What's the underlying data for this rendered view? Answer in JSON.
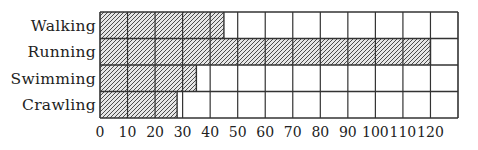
{
  "chart_data": {
    "type": "bar",
    "orientation": "horizontal",
    "title": "",
    "xlabel": "",
    "ylabel": "",
    "categories": [
      "Walking",
      "Running",
      "Swimming",
      "Crawling"
    ],
    "values": [
      45,
      120,
      35,
      28
    ],
    "xlim": [
      0,
      130
    ],
    "x_ticks": [
      0,
      10,
      20,
      30,
      40,
      50,
      60,
      70,
      80,
      90,
      100,
      110,
      120
    ],
    "grid": true,
    "legend": null,
    "bar_fill": "hatched",
    "colors": {
      "grid": "#333333",
      "hatch_bg": "#e6e6e6",
      "hatch_line": "#3a3a3a",
      "text": "#222222"
    }
  }
}
